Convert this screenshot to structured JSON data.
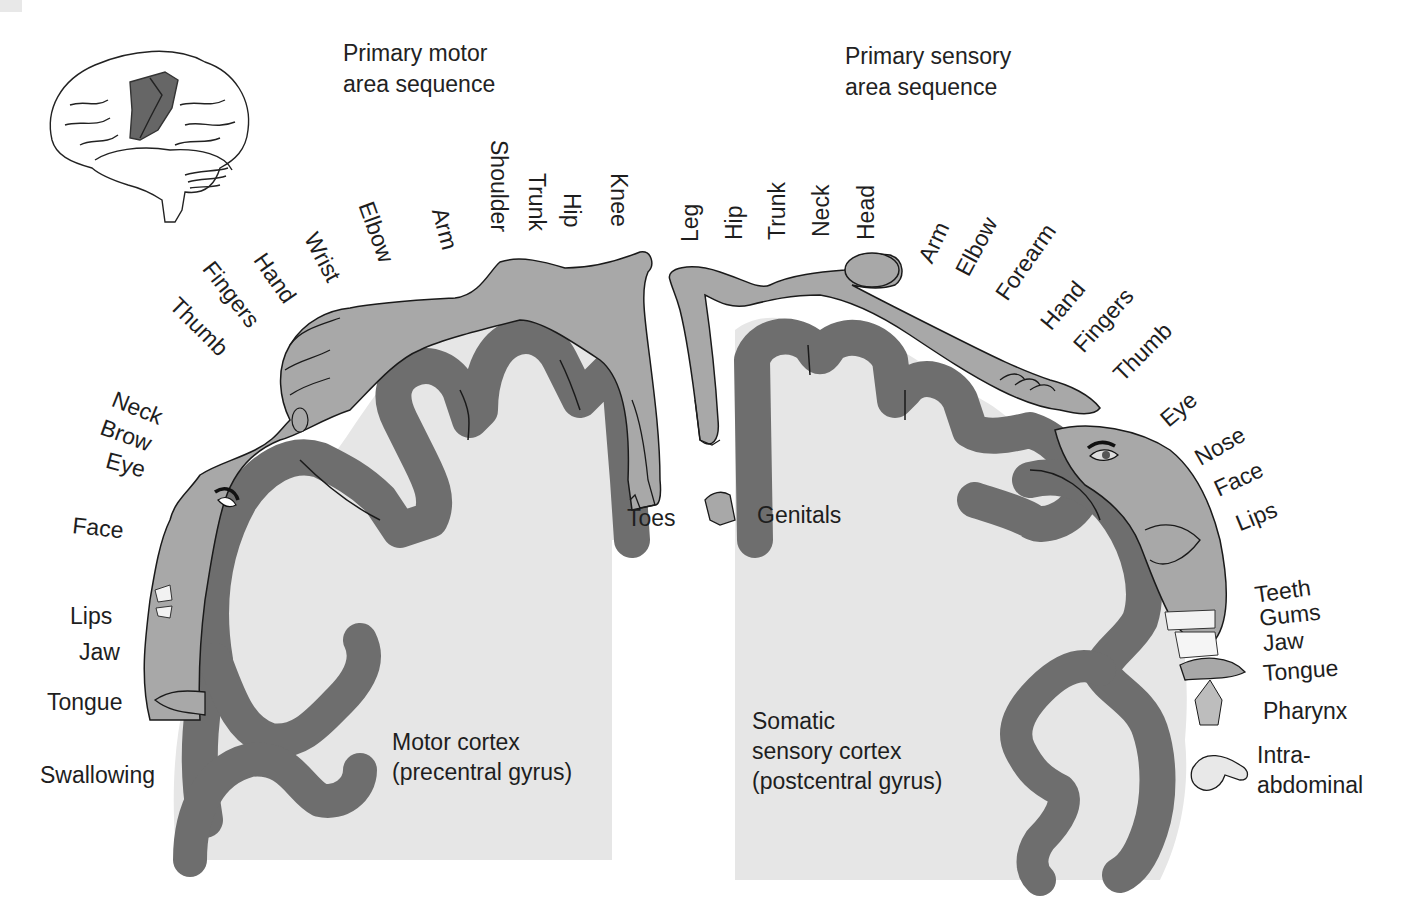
{
  "colors": {
    "background": "#ffffff",
    "cortex_interior": "#e6e6e6",
    "cortex_band": "#6e6e6e",
    "homunculus": "#a8a8a8",
    "outline": "#1a1a1a",
    "text": "#1e1e1e"
  },
  "inset_brain": {
    "label": "brain-lateral-view",
    "highlight": "precentral and postcentral gyri"
  },
  "headings": {
    "motor": [
      "Primary motor",
      "area sequence"
    ],
    "sensory": [
      "Primary sensory",
      "area sequence"
    ]
  },
  "motor": {
    "cortex_label": [
      "Motor cortex",
      "(precentral gyrus)"
    ],
    "body_parts": [
      "Toes",
      "Knee",
      "Hip",
      "Trunk",
      "Shoulder",
      "Arm",
      "Elbow",
      "Wrist",
      "Hand",
      "Fingers",
      "Thumb",
      "Neck",
      "Brow",
      "Eye",
      "Face",
      "Lips",
      "Jaw",
      "Tongue",
      "Swallowing"
    ]
  },
  "sensory": {
    "cortex_label": [
      "Somatic",
      "sensory cortex",
      "(postcentral gyrus)"
    ],
    "body_parts": [
      "Genitals",
      "Leg",
      "Hip",
      "Trunk",
      "Neck",
      "Head",
      "Arm",
      "Elbow",
      "Forearm",
      "Hand",
      "Fingers",
      "Thumb",
      "Eye",
      "Nose",
      "Face",
      "Lips",
      "Teeth",
      "Gums",
      "Jaw",
      "Tongue",
      "Pharynx",
      "Intra-",
      "abdominal"
    ]
  }
}
